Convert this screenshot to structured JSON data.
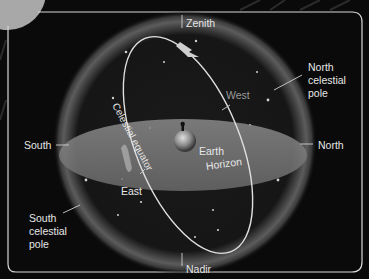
{
  "diagram": {
    "colors": {
      "background": "#0a0a0a",
      "frame": "#d8d8d8",
      "horizon_disk": "#7a7a7a",
      "sphere_glow": "#9a9a9a",
      "equator_line": "#e0e0e0",
      "text": "#e6e6e6",
      "text_dim": "#9a9a9a"
    },
    "labels": {
      "zenith": "Zenith",
      "nadir": "Nadir",
      "north": "North",
      "south": "South",
      "east": "East",
      "west": "West",
      "earth": "Earth",
      "horizon": "Horizon",
      "celestial_equator": "Celestial equator",
      "north_celestial_pole_1": "North",
      "north_celestial_pole_2": "celestial",
      "north_celestial_pole_3": "pole",
      "south_celestial_pole_1": "South",
      "south_celestial_pole_2": "celestial",
      "south_celestial_pole_3": "pole"
    },
    "icons": {
      "earth": "earth-globe-icon",
      "arrow_top": "rotation-arrow-icon",
      "arrow_left": "rotation-arrow-icon"
    }
  }
}
